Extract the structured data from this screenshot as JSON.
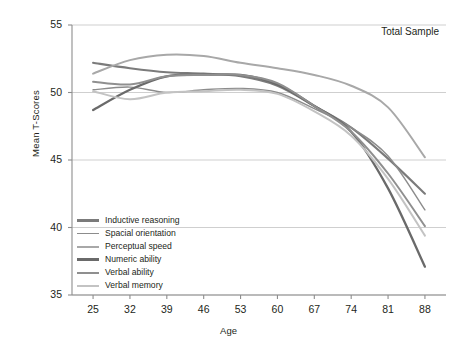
{
  "chart_data": {
    "type": "line",
    "title": "",
    "annotation": "Total Sample",
    "xlabel": "Age",
    "ylabel": "Mean T-Scores",
    "categories": [
      25,
      32,
      39,
      46,
      53,
      60,
      67,
      74,
      81,
      88
    ],
    "x": [
      25,
      32,
      39,
      46,
      53,
      60,
      67,
      74,
      81,
      88
    ],
    "xlim": [
      21,
      92
    ],
    "ylim": [
      35,
      55
    ],
    "yticks": [
      35,
      40,
      45,
      50,
      55
    ],
    "xticks": [
      25,
      32,
      39,
      46,
      53,
      60,
      67,
      74,
      81,
      88
    ],
    "grid": "horizontal",
    "legend_position": "lower-left-inside",
    "series": [
      {
        "name": "Inductive reasoning",
        "color": "#7b7b7b",
        "width": 2.1,
        "values": [
          52.2,
          51.8,
          51.5,
          51.4,
          51.2,
          50.5,
          49.0,
          47.4,
          45.1,
          42.5
        ]
      },
      {
        "name": "Spacial orientation",
        "color": "#8c8c8c",
        "width": 1.4,
        "values": [
          50.2,
          50.4,
          50.0,
          50.2,
          50.3,
          50.0,
          48.8,
          47.4,
          45.3,
          41.3
        ]
      },
      {
        "name": "Perceptual speed",
        "color": "#a8a8a8",
        "width": 2.0,
        "values": [
          51.4,
          52.4,
          52.8,
          52.7,
          52.2,
          51.8,
          51.3,
          50.5,
          48.9,
          45.2
        ]
      },
      {
        "name": "Numeric ability",
        "color": "#6a6a6a",
        "width": 2.3,
        "values": [
          48.7,
          50.2,
          51.2,
          51.3,
          51.3,
          50.6,
          49.0,
          47.1,
          42.9,
          37.1
        ]
      },
      {
        "name": "Verbal ability",
        "color": "#8f8f8f",
        "width": 2.0,
        "values": [
          50.8,
          50.6,
          51.2,
          51.3,
          51.3,
          50.7,
          49.0,
          47.1,
          44.0,
          40.1
        ]
      },
      {
        "name": "Verbal memory",
        "color": "#c3c3c3",
        "width": 2.0,
        "values": [
          50.1,
          49.5,
          50.0,
          50.1,
          50.2,
          49.9,
          48.6,
          46.8,
          43.6,
          39.4
        ]
      }
    ]
  },
  "axes": {
    "y_tick_labels": [
      "55",
      "50",
      "45",
      "40",
      "35"
    ],
    "x_tick_labels": [
      "25",
      "32",
      "39",
      "46",
      "53",
      "60",
      "67",
      "74",
      "81",
      "88"
    ],
    "x_axis_title": "Age",
    "y_axis_title": "Mean T-Scores"
  },
  "annotations": {
    "total_sample": "Total Sample"
  },
  "legend": {
    "items": [
      {
        "label": "Inductive reasoning"
      },
      {
        "label": "Spacial orientation"
      },
      {
        "label": "Perceptual speed"
      },
      {
        "label": "Numeric ability"
      },
      {
        "label": "Verbal ability"
      },
      {
        "label": "Verbal memory"
      }
    ]
  },
  "colors": {
    "axis": "#8d8d8d",
    "grid": "#c9c9c9",
    "text": "#231f20",
    "background": "#ffffff"
  }
}
